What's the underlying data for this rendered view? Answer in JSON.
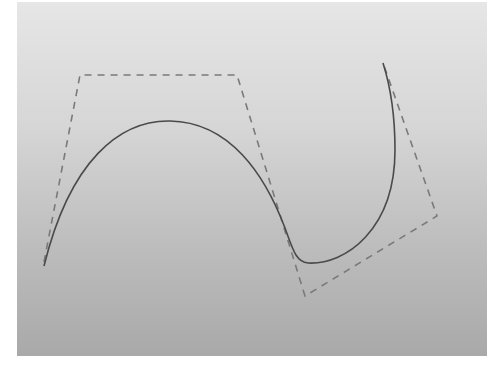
{
  "diagram": {
    "type": "bezier-curve-with-control-polygon",
    "panel": {
      "x": 17,
      "y": 2,
      "width": 470,
      "height": 354,
      "gradient_top": "#e6e6e6",
      "gradient_bottom": "#a9a9a9"
    },
    "control_polygon": {
      "style": "dashed",
      "color": "#7a7a7a",
      "points": [
        [
          44,
          262
        ],
        [
          80,
          75
        ],
        [
          237,
          75
        ],
        [
          305,
          296
        ],
        [
          437,
          216
        ],
        [
          383,
          63
        ]
      ]
    },
    "curve": {
      "style": "solid",
      "color": "#4a4a4a",
      "path": "M 44 266 C 70 160, 120 120, 170 121 C 230 122, 265 175, 285 228 C 293 250, 296 262, 308 263 C 345 265, 395 230, 395 150 C 395 110, 390 85, 383 63"
    }
  }
}
